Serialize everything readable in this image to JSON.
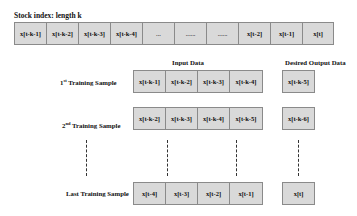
{
  "top": {
    "title": "Stock index: length k",
    "cells": [
      "x[t-k-1]",
      "x[t-k-2]",
      "x[t-k-3]",
      "x[t-k-4]",
      "...",
      "......",
      "......",
      "x[t-2]",
      "x[t-1]",
      "x[t]"
    ]
  },
  "headers": {
    "input": "Input Data",
    "output": "Desired Output Data"
  },
  "samples": [
    {
      "label_num": "1",
      "label_sup": "st",
      "label_text": " Training Sample",
      "inputs": [
        "x[t-k-1]",
        "x[t-k-2]",
        "x[t-k-3]",
        "x[t-k-4]"
      ],
      "output": "x[t-k-5]"
    },
    {
      "label_num": "2",
      "label_sup": "nd",
      "label_text": "  Training Sample",
      "inputs": [
        "x[t-k-2]",
        "x[t-k-3]",
        "x[t-k-4]",
        "x[t-k-5]"
      ],
      "output": "x[t-k-6]"
    },
    {
      "label_num": "",
      "label_sup": "",
      "label_text": "Last Training Sample",
      "inputs": [
        "x[t-4]",
        "x[t-3]",
        "x[t-2]",
        "x[t-1]"
      ],
      "output": "x[t]"
    }
  ],
  "colors": {
    "cell_fill": "#d9d9d9",
    "cell_border": "#8a8a8a"
  }
}
